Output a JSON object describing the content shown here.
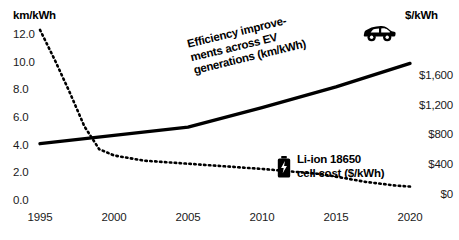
{
  "axes": {
    "left_title": "km/kWh",
    "right_title": "$/kWh",
    "left_ticks": [
      "12.0",
      "10.0",
      "8.0",
      "6.0",
      "4.0",
      "2.0",
      "0.0"
    ],
    "right_ticks": [
      "$1,600",
      "$1,200",
      "$800",
      "$400",
      "$0"
    ],
    "x_ticks": [
      "1995",
      "2000",
      "2005",
      "2010",
      "2015",
      "2020"
    ]
  },
  "annotations": {
    "efficiency_line_1": "Efficiency improve-",
    "efficiency_line_2": "ments across EV",
    "efficiency_line_3": "generations (km/kWh)",
    "cost_line_1": "Li-ion 18650",
    "cost_line_2": "cell cost ($/kWh)"
  },
  "icons": {
    "car": "car-icon",
    "battery": "battery-icon"
  },
  "colors": {
    "line": "#000000",
    "text": "#111111",
    "background": "#ffffff"
  },
  "chart_data": {
    "type": "line",
    "title": "",
    "xlabel": "",
    "ylabel": "km/kWh",
    "y2label": "$/kWh",
    "grid": false,
    "legend": "annotations-inline",
    "xlim": [
      1995,
      2020
    ],
    "ylim": [
      0.0,
      12.0
    ],
    "y2lim": [
      0,
      1600
    ],
    "ytick_values": [
      0.0,
      2.0,
      4.0,
      6.0,
      8.0,
      10.0,
      12.0
    ],
    "y2tick_values": [
      0,
      400,
      800,
      1200,
      1600
    ],
    "xtick_values": [
      1995,
      2000,
      2005,
      2010,
      2015,
      2020
    ],
    "series": [
      {
        "name": "Efficiency improvements across EV generations (km/kWh)",
        "axis": "left",
        "style": "solid",
        "x": [
          1995,
          2000,
          2005,
          2010,
          2015,
          2020
        ],
        "values": [
          4.0,
          4.6,
          5.2,
          6.6,
          8.1,
          9.8
        ]
      },
      {
        "name": "Li-ion 18650 cell cost ($/kWh)",
        "axis": "right",
        "style": "dotted",
        "x": [
          1995,
          1996,
          1997,
          1998,
          1999,
          2000,
          2002,
          2005,
          2008,
          2010,
          2012,
          2014,
          2015,
          2017,
          2019,
          2020
        ],
        "values": [
          1630,
          1340,
          1030,
          700,
          480,
          420,
          370,
          340,
          310,
          290,
          265,
          240,
          215,
          165,
          130,
          120
        ]
      }
    ]
  }
}
